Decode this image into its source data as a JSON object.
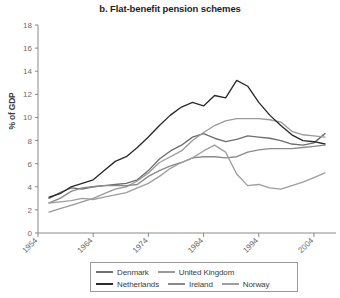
{
  "chart_data": {
    "type": "line",
    "title": "b. Flat-benefit pension schemes",
    "xlabel": "",
    "ylabel": "% of GDP",
    "xlim": [
      1954,
      2008
    ],
    "ylim": [
      0,
      18
    ],
    "ytick_labels": [
      "0",
      "2",
      "4",
      "6",
      "8",
      "10",
      "12",
      "14",
      "16",
      "18"
    ],
    "ytick_values": [
      0,
      2,
      4,
      6,
      8,
      10,
      12,
      14,
      16,
      18
    ],
    "xtick_labels": [
      "1954",
      "1964",
      "1974",
      "1984",
      "1994",
      "2004"
    ],
    "xtick_values": [
      1954,
      1964,
      1974,
      1984,
      1994,
      2004
    ],
    "grid": false,
    "legend_position": "bottom",
    "series": [
      {
        "name": "Denmark",
        "color": "#6e6e6e",
        "x": [
          1956,
          1958,
          1960,
          1962,
          1964,
          1966,
          1968,
          1970,
          1972,
          1974,
          1976,
          1978,
          1980,
          1982,
          1984,
          1986,
          1988,
          1990,
          1992,
          1994,
          1996,
          1998,
          2000,
          2002,
          2004,
          2006
        ],
        "values": [
          3.0,
          3.5,
          3.9,
          3.8,
          4.0,
          4.1,
          4.2,
          4.3,
          4.6,
          5.4,
          6.4,
          7.1,
          7.6,
          8.3,
          8.6,
          8.2,
          7.9,
          8.1,
          8.4,
          8.3,
          8.2,
          8.0,
          7.7,
          7.6,
          7.8,
          8.6
        ]
      },
      {
        "name": "United Kingdom",
        "color": "#9a9a9a",
        "x": [
          1956,
          1958,
          1960,
          1962,
          1964,
          1966,
          1968,
          1970,
          1972,
          1974,
          1976,
          1978,
          1980,
          1982,
          1984,
          1986,
          1988,
          1990,
          1992,
          1994,
          1996,
          1998,
          2000,
          2002,
          2004,
          2006
        ],
        "values": [
          1.8,
          2.1,
          2.4,
          2.7,
          3.0,
          3.4,
          3.8,
          4.0,
          4.5,
          5.2,
          6.1,
          6.6,
          7.1,
          8.0,
          8.7,
          9.3,
          9.7,
          9.9,
          9.9,
          9.9,
          9.8,
          9.6,
          8.8,
          8.5,
          8.4,
          8.3
        ]
      },
      {
        "name": "Netherlands",
        "color": "#2a2a2a",
        "x": [
          1956,
          1958,
          1960,
          1962,
          1964,
          1966,
          1968,
          1970,
          1972,
          1974,
          1976,
          1978,
          1980,
          1982,
          1984,
          1986,
          1988,
          1990,
          1992,
          1994,
          1996,
          1998,
          2000,
          2002,
          2004,
          2006
        ],
        "values": [
          3.1,
          3.4,
          4.0,
          4.3,
          4.6,
          5.4,
          6.2,
          6.6,
          7.4,
          8.3,
          9.3,
          10.2,
          10.9,
          11.3,
          11.0,
          11.9,
          11.7,
          13.2,
          12.7,
          11.3,
          10.2,
          9.3,
          8.5,
          8.0,
          7.9,
          7.7
        ]
      },
      {
        "name": "Ireland",
        "color": "#8a8a8a",
        "x": [
          1956,
          1958,
          1960,
          1962,
          1964,
          1966,
          1968,
          1970,
          1972,
          1974,
          1976,
          1978,
          1980,
          1982,
          1984,
          1986,
          1988,
          1990,
          1992,
          1994,
          1996,
          1998,
          2000,
          2002,
          2004,
          2006
        ],
        "values": [
          2.6,
          3.0,
          3.6,
          3.9,
          4.0,
          4.1,
          4.1,
          4.1,
          4.2,
          4.9,
          5.4,
          5.8,
          6.1,
          6.5,
          6.6,
          6.6,
          6.5,
          6.6,
          7.0,
          7.2,
          7.3,
          7.3,
          7.3,
          7.4,
          7.5,
          7.6
        ]
      },
      {
        "name": "Norway",
        "color": "#9e9e9e",
        "x": [
          1956,
          1958,
          1960,
          1962,
          1964,
          1966,
          1968,
          1970,
          1972,
          1974,
          1976,
          1978,
          1980,
          1982,
          1984,
          1986,
          1988,
          1990,
          1992,
          1994,
          1996,
          1998,
          2000,
          2002,
          2004,
          2006
        ],
        "values": [
          2.6,
          2.7,
          2.8,
          3.0,
          2.9,
          3.1,
          3.3,
          3.5,
          3.9,
          4.3,
          4.9,
          5.6,
          6.1,
          6.5,
          7.1,
          7.6,
          7.0,
          5.1,
          4.1,
          4.2,
          3.9,
          3.8,
          4.1,
          4.4,
          4.8,
          5.2
        ]
      }
    ]
  },
  "legend": {
    "rows": [
      [
        {
          "label": "Denmark",
          "color": "#6e6e6e"
        },
        {
          "label": "United Kingdom",
          "color": "#9a9a9a"
        }
      ],
      [
        {
          "label": "Netherlands",
          "color": "#2a2a2a"
        },
        {
          "label": "Ireland",
          "color": "#8a8a8a"
        },
        {
          "label": "Norway",
          "color": "#9e9e9e"
        }
      ]
    ]
  }
}
